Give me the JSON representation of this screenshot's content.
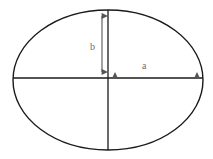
{
  "figure": {
    "type": "geometry-diagram",
    "background_color": "#ffffff"
  },
  "labels": {
    "semi_minor": "b",
    "semi_major": "a"
  },
  "colors": {
    "outline": "#1a1a1a",
    "axis_line": "#1a1a1a",
    "dimension_arrow": "#555555",
    "label_text": "#6e6e6e"
  },
  "geometry": {
    "center_x": 108,
    "center_y": 78,
    "radius_x": 95,
    "radius_y": 68,
    "vertical_axis_top_y": 10,
    "vertical_axis_bottom_y": 150,
    "horizontal_axis_left_x": 13,
    "horizontal_axis_right_x": 203
  },
  "dimension_arrows": [
    {
      "name": "b-arrow",
      "orientation": "vertical",
      "label": "b",
      "from_x": 102,
      "from_y": 11,
      "to_x": 102,
      "to_y": 78,
      "arrowheads": "both"
    },
    {
      "name": "a-arrow",
      "orientation": "horizontal",
      "label": "a",
      "from_x": 110,
      "from_y": 78,
      "to_x": 202,
      "to_y": 78,
      "arrowheads": "both"
    }
  ]
}
